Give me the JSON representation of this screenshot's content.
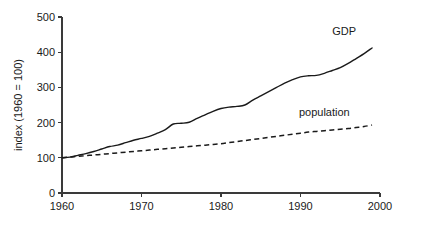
{
  "chart_data": {
    "type": "line",
    "title": "",
    "subtitle": "",
    "xlabel": "",
    "ylabel": "index (1960 = 100)",
    "xlim": [
      1960,
      2000
    ],
    "ylim": [
      0,
      500
    ],
    "grid": false,
    "legend_position": "inline-annotation",
    "x_ticks": [
      1960,
      1970,
      1980,
      1990,
      2000
    ],
    "x_tick_labels": [
      "1960",
      "1970",
      "1980",
      "1990",
      "2000"
    ],
    "y_ticks": [
      0,
      100,
      200,
      300,
      400,
      500
    ],
    "y_tick_labels": [
      "0",
      "100",
      "200",
      "300",
      "400",
      "500"
    ],
    "x": [
      1960,
      1961,
      1962,
      1963,
      1964,
      1965,
      1966,
      1967,
      1968,
      1969,
      1970,
      1971,
      1972,
      1973,
      1974,
      1975,
      1976,
      1977,
      1978,
      1979,
      1980,
      1981,
      1982,
      1983,
      1984,
      1985,
      1986,
      1987,
      1988,
      1989,
      1990,
      1991,
      1992,
      1993,
      1994,
      1995,
      1996,
      1997,
      1998,
      1999
    ],
    "series": [
      {
        "name": "GDP",
        "style": "solid",
        "color": "#1a1a1a",
        "label_text": "GDP",
        "values": [
          100,
          102,
          107,
          112,
          118,
          125,
          132,
          136,
          143,
          150,
          155,
          161,
          170,
          180,
          196,
          198,
          201,
          212,
          222,
          232,
          240,
          244,
          246,
          250,
          264,
          276,
          288,
          300,
          312,
          322,
          330,
          333,
          334,
          340,
          348,
          356,
          368,
          382,
          396,
          412
        ]
      },
      {
        "name": "population",
        "style": "dashed",
        "color": "#1a1a1a",
        "label_text": "population",
        "values": [
          100,
          102,
          104,
          106,
          108,
          110,
          112,
          114,
          116,
          118,
          120,
          122,
          124,
          126,
          128,
          130,
          132,
          134,
          136,
          138,
          140,
          143,
          146,
          149,
          152,
          155,
          158,
          161,
          164,
          167,
          170,
          173,
          175,
          177,
          179,
          181,
          183,
          186,
          189,
          193
        ]
      }
    ],
    "annotations": [
      {
        "name": "gdp-label",
        "text": "GDP",
        "x": 1995.5,
        "y": 448
      },
      {
        "name": "population-label",
        "text": "population",
        "x": 1993.0,
        "y": 218
      }
    ]
  }
}
